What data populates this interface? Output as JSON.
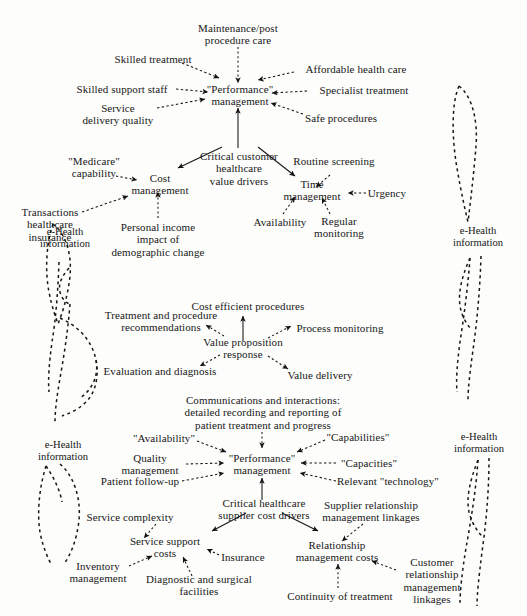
{
  "diagram": {
    "background": "#fdfdfc",
    "ink": "#171717"
  },
  "clusters": {
    "customer_value": {
      "hub": "\"Performance\"\nmanagement",
      "driver": "Critical customer\nhealthcare\nvalue drivers",
      "inputs": [
        "Maintenance/post\nprocedure care",
        "Skilled treatment",
        "Affordable health care",
        "Skilled support staff",
        "Specialist treatment",
        "Service\ndelivery quality",
        "Safe procedures"
      ]
    },
    "cost_management": {
      "hub": "Cost\nmanagement",
      "inputs": [
        "\"Medicare\"\ncapability",
        "Transactions\nhealthcare\ninsurance",
        "Personal income\nimpact of\ndemographic change"
      ]
    },
    "time_management": {
      "hub": "Time\nmanagement",
      "inputs": [
        "Routine screening",
        "Urgency",
        "Availability",
        "Regular\nmonitoring"
      ]
    },
    "value_proposition": {
      "hub": "Value proposition\nresponse",
      "outputs": [
        "Cost efficient procedures",
        "Treatment and procedure\nrecommendations",
        "Process monitoring",
        "Evaluation and diagnosis",
        "Value delivery"
      ]
    },
    "supplier_performance": {
      "hub": "\"Performance\"\nmanagement",
      "driver": "Critical healthcare\nsupplier cost drivers",
      "inputs": [
        "Communications and interactions:\ndetailed recording and reporting of\npatient treatment and progress",
        "\"Availability\"",
        "\"Capabilities\"",
        "Quality\nmanagement",
        "\"Capacities\"",
        "Patient follow-up",
        "Relevant \"technology\""
      ]
    },
    "service_support": {
      "hub": "Service support\ncosts",
      "inputs": [
        "Service complexity",
        "Insurance",
        "Inventory\nmanagement",
        "Diagnostic and surgical\nfacilities"
      ]
    },
    "relationship_costs": {
      "hub": "Relationship\nmanagement costs",
      "inputs": [
        "Supplier relationship\nmanagement linkages",
        "Customer\nrelationship\nmanagement\nlinkages",
        "Continuity of treatment"
      ]
    }
  },
  "annotations": {
    "ehealth_label": "e-Health\ninformation",
    "instances": [
      {
        "id": "left-upper",
        "x": 65,
        "y": 238
      },
      {
        "id": "left-lower",
        "x": 63,
        "y": 451
      },
      {
        "id": "right-upper",
        "x": 478,
        "y": 237
      },
      {
        "id": "right-lower",
        "x": 479,
        "y": 443
      }
    ]
  }
}
